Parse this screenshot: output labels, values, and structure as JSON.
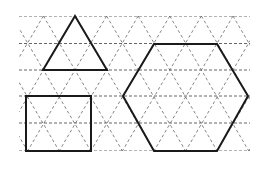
{
  "diagram": {
    "type": "triangular-dot-grid-with-shapes",
    "width": 264,
    "height": 191,
    "grid": {
      "x_min": 19,
      "x_max": 250,
      "rows_y": [
        16,
        43.5,
        70,
        96,
        123,
        151
      ],
      "x_step": 31.6,
      "row_offsets": [
        75,
        59.2,
        75,
        59.2,
        75,
        59.2
      ],
      "stroke_color": "#555555"
    },
    "shapes": [
      {
        "name": "triangle",
        "points": [
          [
            75,
            16
          ],
          [
            107,
            70
          ],
          [
            43,
            70
          ]
        ]
      },
      {
        "name": "hexagon",
        "points": [
          [
            154,
            44
          ],
          [
            217,
            44
          ],
          [
            248,
            96
          ],
          [
            217,
            151
          ],
          [
            154,
            151
          ],
          [
            123,
            96
          ]
        ]
      },
      {
        "name": "rectangle",
        "points": [
          [
            26,
            96
          ],
          [
            91,
            96
          ],
          [
            91,
            151
          ],
          [
            26,
            151
          ]
        ]
      }
    ],
    "shape_color": "#1a1a1a"
  }
}
